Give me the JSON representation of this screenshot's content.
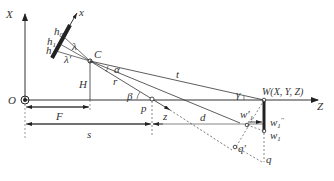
{
  "diagram": {
    "axes": {
      "vertical_axis": "X",
      "horizontal_axis": "Z",
      "origin": "O",
      "camera_axis": "x"
    },
    "labels": {
      "h0": "h",
      "h0_sub": "0",
      "h1": "h",
      "h1_sub": "1",
      "h": "h",
      "lambda": "λ",
      "lambda_prime": "λ'",
      "camera_center": "C",
      "height": "H",
      "alpha": "α",
      "range_r": "r",
      "range_t": "t",
      "beta": "β",
      "gamma": "γ",
      "point_p": "p",
      "distance_z": "z",
      "distance_d": "d",
      "focal_F": "F",
      "distance_s": "s",
      "world_point": "W(X, Y, Z)",
      "w1_prime": "w'",
      "w1_prime_sub": "1",
      "w1_dprime": "w",
      "w1_dprime_sub": "1",
      "w1_dprime_sup": "''",
      "w1": "w",
      "w1_sub": "1",
      "q_prime": "q'",
      "q": "q"
    },
    "colors": {
      "line": "#333333",
      "thick": "#222222",
      "dashed": "#555555"
    }
  }
}
